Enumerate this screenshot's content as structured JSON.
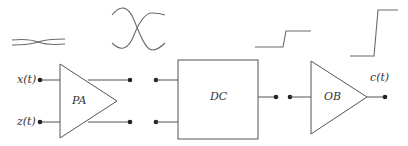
{
  "diagram": {
    "type": "signal-processing-block-diagram",
    "inputs": [
      {
        "id": "x",
        "label": "x(t)"
      },
      {
        "id": "z",
        "label": "z(t)"
      }
    ],
    "output": {
      "id": "c",
      "label": "c(t)"
    },
    "blocks": [
      {
        "id": "PA",
        "label": "PA",
        "shape": "triangle-amplifier"
      },
      {
        "id": "DC",
        "label": "DC",
        "shape": "rectangle"
      },
      {
        "id": "OB",
        "label": "OB",
        "shape": "triangle-amplifier"
      }
    ],
    "waveforms": [
      {
        "id": "wave-small-crossing",
        "description": "small-amplitude crossing sinusoids (input signals)"
      },
      {
        "id": "wave-large-crossing",
        "description": "large-amplitude crossing sinusoids (after PA)"
      },
      {
        "id": "wave-small-step",
        "description": "small step (DC output)"
      },
      {
        "id": "wave-large-step",
        "description": "large sharp step (OB output)"
      }
    ],
    "colors": {
      "line": "#555555",
      "dot": "#222222",
      "text": "#333333",
      "background": "#ffffff"
    }
  }
}
